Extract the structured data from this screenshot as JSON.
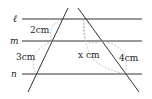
{
  "diagram": {
    "parallel_lines": [
      {
        "name": "ℓ",
        "y": 19
      },
      {
        "name": "m",
        "y": 41
      },
      {
        "name": "n",
        "y": 74
      }
    ],
    "segments": {
      "left_upper": "2cm",
      "left_lower": "3cm",
      "right_upper": "x cm",
      "right_lower": "4cm"
    },
    "colors": {
      "line": "#333333",
      "dashed": "#aaaaaa"
    }
  }
}
